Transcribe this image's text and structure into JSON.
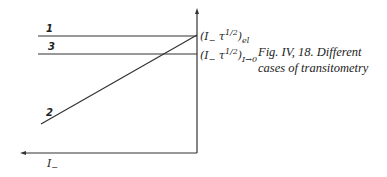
{
  "figure": {
    "caption_line1": "Fig. IV, 18. Different",
    "caption_line2": "cases of transitometry",
    "x_axis_label": "I",
    "x_axis_label_sub": "−",
    "level_el": {
      "base": "(I",
      "sub_minus": "−",
      "tau": " τ",
      "exp": "1/2",
      "close": ")",
      "subscript": "el"
    },
    "level_i0": {
      "base": "(I",
      "sub_minus": "−",
      "tau": " τ",
      "exp": "1/2",
      "close": ")",
      "subscript": "I→0"
    },
    "curves": [
      {
        "label": "1",
        "type": "horizontal"
      },
      {
        "label": "3",
        "type": "horizontal"
      },
      {
        "label": "2",
        "type": "rising"
      }
    ]
  }
}
